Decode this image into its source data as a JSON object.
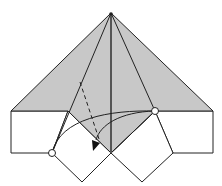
{
  "diagram": {
    "title": "",
    "colors": {
      "paper_colored": "#c8c8c8",
      "paper_white": "#ffffff",
      "line": "#222222",
      "center_crease": "#555555"
    },
    "symbols": {
      "valley_fold": "dashed-line",
      "fold_arrow": "curved-arrow",
      "reference_points": "open-circles"
    }
  }
}
